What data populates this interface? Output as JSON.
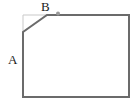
{
  "figure": {
    "labels": {
      "a": "A",
      "b": "B"
    },
    "colors": {
      "background": "#ffffff",
      "outline": "#6b6b6b",
      "ghost_corner": "#c9c9c9",
      "dot": "#9a9a9a",
      "label_text": "#1a1a1a"
    },
    "shape": {
      "outline_points": "47,15 129,15 129,97 23,97 23,32",
      "ghost_corner_points": "23,32 23,15 47,15",
      "dot": {
        "cx": "58",
        "cy": "13.5",
        "r": "2"
      }
    }
  }
}
